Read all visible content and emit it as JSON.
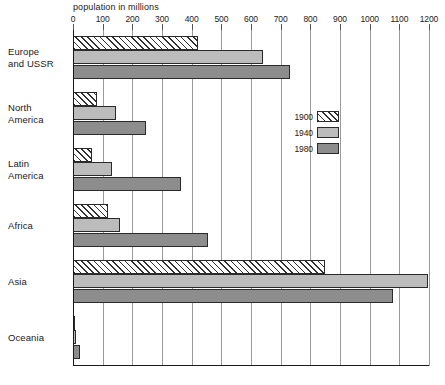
{
  "chart_data": {
    "type": "bar",
    "title": "population in millions",
    "orientation": "horizontal",
    "xlabel": "population in millions",
    "ylabel": "",
    "xlim": [
      0,
      1200
    ],
    "xticks": [
      0,
      100,
      200,
      300,
      400,
      500,
      600,
      700,
      800,
      900,
      1000,
      1100,
      1200
    ],
    "grid": true,
    "legend_position": "middle-right",
    "categories": [
      "Europe\nand USSR",
      "North\nAmerica",
      "Latin\nAmerica",
      "Africa",
      "Asia",
      "Oceania"
    ],
    "series": [
      {
        "name": "1900",
        "pattern": "diagonal-hatch",
        "color": "#ffffff",
        "values": [
          423,
          81,
          63,
          118,
          850,
          6
        ]
      },
      {
        "name": "1940",
        "pattern": "solid",
        "color": "#bcbcbc",
        "values": [
          640,
          144,
          130,
          160,
          1195,
          11
        ]
      },
      {
        "name": "1980",
        "pattern": "solid",
        "color": "#8d8d8d",
        "values": [
          730,
          246,
          364,
          455,
          1080,
          23
        ]
      }
    ]
  },
  "legend": {
    "items": [
      {
        "label": "1900"
      },
      {
        "label": "1940"
      },
      {
        "label": "1980"
      }
    ]
  },
  "colors": {
    "hatch_line": "#2f2f2f",
    "series_1940": "#bcbcbc",
    "series_1980": "#8d8d8d",
    "axis": "#1a1a1a",
    "gridline": "#9a9a9a",
    "background": "#ffffff"
  }
}
